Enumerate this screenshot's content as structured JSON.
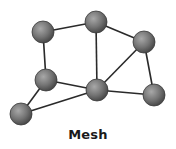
{
  "title": "Mesh",
  "diagram": {
    "type": "mesh-network-topology",
    "node_radius": 11,
    "colors": {
      "edge": "#2a2a2a",
      "node_light": "#9a9a9a",
      "node_dark": "#4a4a4a",
      "node_stroke": "#3a3a3a"
    },
    "nodes": [
      {
        "id": "n1",
        "x": 43,
        "y": 32
      },
      {
        "id": "n2",
        "x": 96,
        "y": 22
      },
      {
        "id": "n3",
        "x": 144,
        "y": 42
      },
      {
        "id": "n4",
        "x": 46,
        "y": 80
      },
      {
        "id": "n5",
        "x": 97,
        "y": 90
      },
      {
        "id": "n6",
        "x": 154,
        "y": 95
      },
      {
        "id": "n7",
        "x": 21,
        "y": 114
      }
    ],
    "edges": [
      [
        "n1",
        "n2"
      ],
      [
        "n1",
        "n4"
      ],
      [
        "n2",
        "n3"
      ],
      [
        "n2",
        "n5"
      ],
      [
        "n3",
        "n5"
      ],
      [
        "n3",
        "n6"
      ],
      [
        "n4",
        "n5"
      ],
      [
        "n4",
        "n7"
      ],
      [
        "n5",
        "n6"
      ],
      [
        "n5",
        "n7"
      ]
    ]
  }
}
